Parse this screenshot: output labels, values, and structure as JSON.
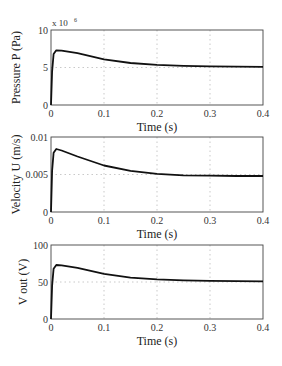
{
  "chart_data": [
    {
      "type": "line",
      "ylabel": "Pressure P (Pa)",
      "xlabel": "Time (s)",
      "y_multiplier_label": "x 10",
      "y_multiplier_exp": "6",
      "xlim": [
        0,
        0.4
      ],
      "ylim": [
        0,
        10
      ],
      "xticks": [
        "0",
        "0.1",
        "0.2",
        "0.3",
        "0.4"
      ],
      "yticks": [
        "0",
        "5",
        "10"
      ],
      "grid": true,
      "series": [
        {
          "name": "P",
          "x": [
            0,
            0.002,
            0.005,
            0.01,
            0.02,
            0.05,
            0.1,
            0.15,
            0.2,
            0.25,
            0.3,
            0.35,
            0.4
          ],
          "values": [
            0,
            4.5,
            6.8,
            7.3,
            7.25,
            6.9,
            6.1,
            5.6,
            5.35,
            5.22,
            5.15,
            5.12,
            5.1
          ]
        }
      ]
    },
    {
      "type": "line",
      "ylabel": "Velocity U (m/s)",
      "xlabel": "Time (s)",
      "xlim": [
        0,
        0.4
      ],
      "ylim": [
        0,
        0.01
      ],
      "xticks": [
        "0",
        "0.1",
        "0.2",
        "0.3",
        "0.4"
      ],
      "yticks": [
        "0",
        "0.005",
        "0.01"
      ],
      "grid": true,
      "series": [
        {
          "name": "U",
          "x": [
            0,
            0.002,
            0.005,
            0.01,
            0.02,
            0.05,
            0.1,
            0.15,
            0.2,
            0.25,
            0.3,
            0.35,
            0.4
          ],
          "values": [
            0,
            0.0055,
            0.0079,
            0.0084,
            0.0082,
            0.0074,
            0.0062,
            0.0055,
            0.0051,
            0.0049,
            0.00485,
            0.0048,
            0.0048
          ]
        }
      ]
    },
    {
      "type": "line",
      "ylabel": "V out (V)",
      "xlabel": "Time (s)",
      "xlim": [
        0,
        0.4
      ],
      "ylim": [
        0,
        100
      ],
      "xticks": [
        "0",
        "0.1",
        "0.2",
        "0.3",
        "0.4"
      ],
      "yticks": [
        "0",
        "50",
        "100"
      ],
      "grid": true,
      "series": [
        {
          "name": "Vout",
          "x": [
            0,
            0.002,
            0.005,
            0.01,
            0.02,
            0.05,
            0.1,
            0.15,
            0.2,
            0.25,
            0.3,
            0.35,
            0.4
          ],
          "values": [
            0,
            45,
            68,
            73,
            72.5,
            69,
            61,
            56,
            53.5,
            52.2,
            51.5,
            51.2,
            51
          ]
        }
      ]
    }
  ]
}
